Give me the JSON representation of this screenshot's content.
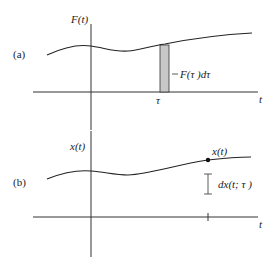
{
  "panel_a": {
    "label": "(a)",
    "y_axis_label": "F(t)",
    "x_axis_label": "t",
    "tau_label": "τ",
    "strip_label": "F(τ )dτ",
    "strip_color": "#c8c8c8"
  },
  "panel_b": {
    "label": "(b)",
    "y_axis_label": "x(t)",
    "x_axis_label": "t",
    "point_label": "x(t)",
    "increment_label": "dx(t; τ )"
  }
}
